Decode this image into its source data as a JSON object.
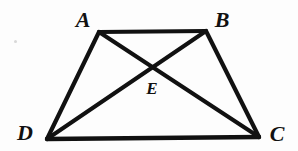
{
  "figure": {
    "kind": "geometry-diagram",
    "background_color": "#fdfdfd",
    "stroke_color": "#111111",
    "canvas": {
      "width": 298,
      "height": 151
    },
    "points": {
      "A": {
        "x": 99,
        "y": 32
      },
      "B": {
        "x": 206,
        "y": 31
      },
      "C": {
        "x": 259,
        "y": 137
      },
      "D": {
        "x": 47,
        "y": 139
      },
      "E": {
        "x": 153,
        "y": 67
      }
    },
    "segments": [
      {
        "name": "AB",
        "from": "A",
        "to": "B",
        "width": 4
      },
      {
        "name": "BC",
        "from": "B",
        "to": "C",
        "width": 4
      },
      {
        "name": "DC",
        "from": "D",
        "to": "C",
        "width": 4
      },
      {
        "name": "AD",
        "from": "A",
        "to": "D",
        "width": 4
      },
      {
        "name": "AC",
        "from": "A",
        "to": "C",
        "width": 4
      },
      {
        "name": "BD",
        "from": "B",
        "to": "D",
        "width": 4
      }
    ],
    "labels": {
      "A": {
        "text": "A",
        "x": 83,
        "y": 20,
        "size": "big"
      },
      "B": {
        "text": "B",
        "x": 222,
        "y": 20,
        "size": "big"
      },
      "C": {
        "text": "C",
        "x": 277,
        "y": 134,
        "size": "big"
      },
      "D": {
        "text": "D",
        "x": 25,
        "y": 133,
        "size": "big"
      },
      "E": {
        "text": "E",
        "x": 152,
        "y": 88,
        "size": "small"
      }
    },
    "artifacts": [
      {
        "name": "scan-speck",
        "x": 14,
        "y": 40
      }
    ]
  }
}
